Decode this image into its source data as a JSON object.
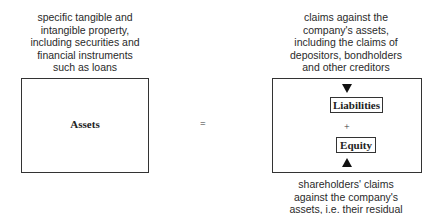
{
  "diagram": {
    "assets": {
      "label": "Assets",
      "description": "specific tangible and\nintangible property,\nincluding securities and\nfinancial instruments\nsuch as loans"
    },
    "operator_equals": "=",
    "right_side": {
      "top_description": "claims against the\ncompany's assets,\nincluding the claims of\ndepositors, bondholders\nand other creditors",
      "liabilities_label": "Liabilities",
      "operator_plus": "+",
      "equity_label": "Equity",
      "bottom_description": "shareholders' claims\nagainst the company's\nassets, i.e. their residual"
    }
  }
}
